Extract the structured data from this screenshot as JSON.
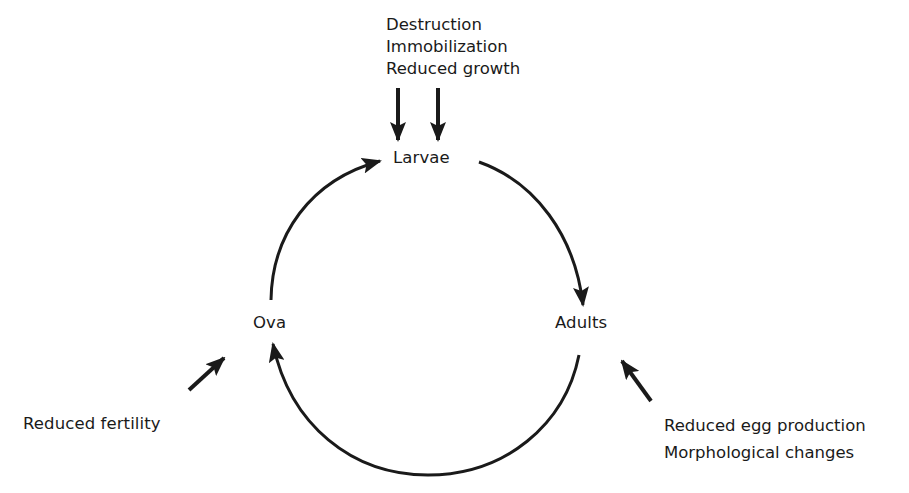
{
  "diagram": {
    "stages": {
      "larvae": "Larvae",
      "adults": "Adults",
      "ova": "Ova"
    },
    "effects": {
      "larvae": [
        "Destruction",
        "Immobilization",
        "Reduced growth"
      ],
      "ova": [
        "Reduced fertility"
      ],
      "adults": [
        "Reduced egg production",
        "Morphological changes"
      ]
    },
    "cycle_order": [
      "Ova",
      "Larvae",
      "Adults",
      "Ova"
    ],
    "colors": {
      "ink": "#1a1a1a",
      "background": "#ffffff"
    }
  }
}
